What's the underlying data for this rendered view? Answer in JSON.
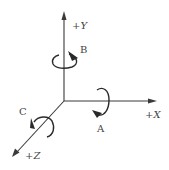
{
  "diagram": {
    "type": "coordinate-axes-rotation",
    "axes": [
      {
        "id": "x",
        "label": "+X"
      },
      {
        "id": "y",
        "label": "+Y"
      },
      {
        "id": "z",
        "label": "+Z"
      }
    ],
    "rotations": [
      {
        "id": "a",
        "label": "A",
        "about_axis": "X"
      },
      {
        "id": "b",
        "label": "B",
        "about_axis": "Y"
      },
      {
        "id": "c",
        "label": "C",
        "about_axis": "Z"
      }
    ],
    "colors": {
      "line": "#3a3a3a",
      "rotation": "#2a2a2a",
      "text": "#444444",
      "background": "#ffffff"
    }
  }
}
